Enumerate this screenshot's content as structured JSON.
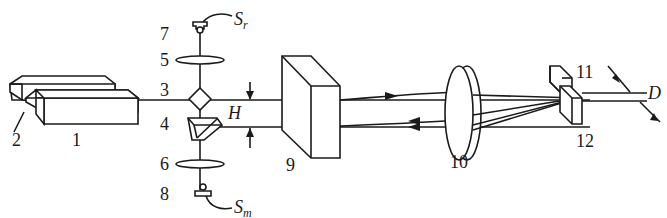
{
  "diagram": {
    "type": "optical-schematic",
    "labels": {
      "n1": "1",
      "n2": "2",
      "n3": "3",
      "n4": "4",
      "n5": "5",
      "n6": "6",
      "n7": "7",
      "n8": "8",
      "n9": "9",
      "n10": "10",
      "n11": "11",
      "n12": "12",
      "H": "H",
      "D": "D",
      "Sr_main": "S",
      "Sr_sub": "r",
      "Sm_main": "S",
      "Sm_sub": "m"
    },
    "components": [
      {
        "id": "1",
        "shape": "rectangular block (laser)"
      },
      {
        "id": "2",
        "shape": "rectangular block (laser)"
      },
      {
        "id": "3",
        "shape": "beam splitter cube (diamond)"
      },
      {
        "id": "4",
        "shape": "prism"
      },
      {
        "id": "5",
        "shape": "lens"
      },
      {
        "id": "6",
        "shape": "lens"
      },
      {
        "id": "7",
        "shape": "detector S_r"
      },
      {
        "id": "8",
        "shape": "detector S_m"
      },
      {
        "id": "9",
        "shape": "block (polarizer/plate)"
      },
      {
        "id": "10",
        "shape": "double lens"
      },
      {
        "id": "11",
        "shape": "small block"
      },
      {
        "id": "12",
        "shape": "small block"
      }
    ],
    "colors": {
      "stroke": "#1a1a1a",
      "background": "#ffffff"
    }
  }
}
